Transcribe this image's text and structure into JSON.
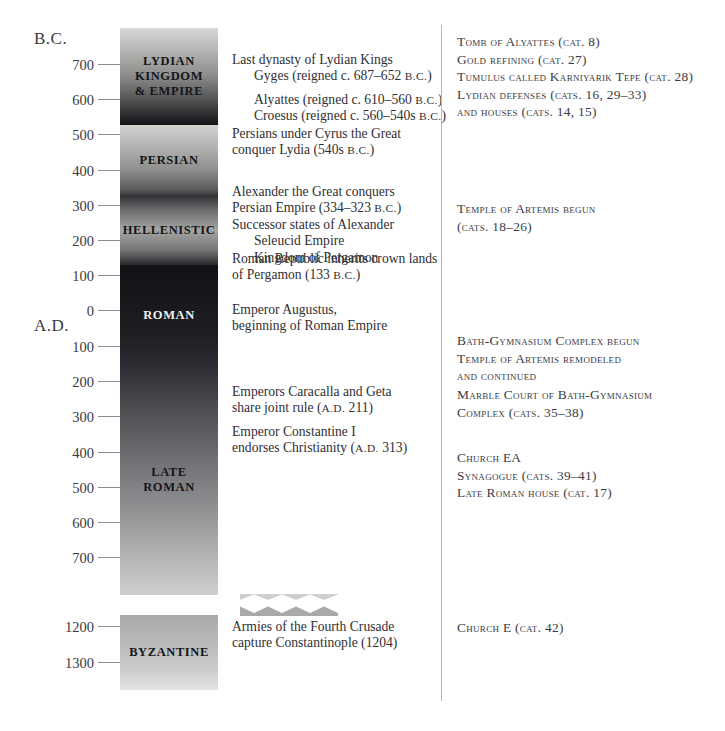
{
  "chart_data": {
    "type": "table",
    "orientation": "vertical",
    "axis": {
      "era_labels": [
        {
          "text": "B.C.",
          "y_px": 38
        },
        {
          "text": "A.D.",
          "y_px": 325
        }
      ],
      "ticks": [
        {
          "label": "700",
          "era": "B.C.",
          "y_px": 65
        },
        {
          "label": "600",
          "era": "B.C.",
          "y_px": 100
        },
        {
          "label": "500",
          "era": "B.C.",
          "y_px": 135
        },
        {
          "label": "400",
          "era": "B.C.",
          "y_px": 171
        },
        {
          "label": "300",
          "era": "B.C.",
          "y_px": 206
        },
        {
          "label": "200",
          "era": "B.C.",
          "y_px": 241
        },
        {
          "label": "100",
          "era": "B.C.",
          "y_px": 276
        },
        {
          "label": "0",
          "era": "",
          "y_px": 311
        },
        {
          "label": "100",
          "era": "A.D.",
          "y_px": 347
        },
        {
          "label": "200",
          "era": "A.D.",
          "y_px": 382
        },
        {
          "label": "300",
          "era": "A.D.",
          "y_px": 417
        },
        {
          "label": "400",
          "era": "A.D.",
          "y_px": 453
        },
        {
          "label": "500",
          "era": "A.D.",
          "y_px": 488
        },
        {
          "label": "600",
          "era": "A.D.",
          "y_px": 523
        },
        {
          "label": "700",
          "era": "A.D.",
          "y_px": 558
        },
        {
          "label": "1200",
          "era": "A.D.",
          "y_px": 627
        },
        {
          "label": "1300",
          "era": "A.D.",
          "y_px": 663
        }
      ],
      "break_between": [
        "700",
        "1200"
      ]
    },
    "periods": [
      {
        "name": "LYDIAN\nKINGDOM\n& EMPIRE",
        "start": "pre-700 B.C.",
        "end": "c. 547 B.C.",
        "y_top_px": 28,
        "y_bottom_px": 125,
        "label_dark": false
      },
      {
        "name": "PERSIAN",
        "start": "c. 547 B.C.",
        "end": "334 B.C.",
        "y_top_px": 125,
        "y_bottom_px": 195,
        "label_dark": false
      },
      {
        "name": "HELLENISTIC",
        "start": "334 B.C.",
        "end": "133 B.C.",
        "y_top_px": 195,
        "y_bottom_px": 265,
        "label_dark": false
      },
      {
        "name": "ROMAN",
        "start": "133 B.C.",
        "end": "c. 284 A.D.",
        "y_top_px": 265,
        "y_bottom_px": 365,
        "label_dark": true
      },
      {
        "name": "LATE\nROMAN",
        "start": "c. 284 A.D.",
        "end": "c. 700 A.D.",
        "y_top_px": 365,
        "y_bottom_px": 595,
        "label_dark": false
      },
      {
        "name": "BYZANTINE",
        "start": "c. 1100 A.D.",
        "end": "1300 A.D.",
        "y_top_px": 615,
        "y_bottom_px": 690,
        "label_dark": false
      }
    ],
    "events": [
      {
        "y_px": 52,
        "lines": [
          "Last dynasty of Lydian Kings",
          "Gyges (reigned c. 687–652 B.C.)"
        ],
        "indents": [
          0,
          1
        ]
      },
      {
        "y_px": 92,
        "lines": [
          "Alyattes (reigned c. 610–560 B.C.)",
          "Croesus (reigned c. 560–540s B.C.)"
        ],
        "indents": [
          1,
          1
        ]
      },
      {
        "y_px": 126,
        "lines": [
          "Persians under Cyrus the Great",
          "conquer Lydia (540s B.C.)"
        ],
        "indents": [
          0,
          0
        ]
      },
      {
        "y_px": 184,
        "lines": [
          "Alexander the Great conquers",
          "Persian Empire (334–323 B.C.)",
          "Successor states of Alexander",
          "Seleucid Empire",
          "Kingdom of Pergamon"
        ],
        "indents": [
          0,
          0,
          0,
          1,
          1
        ]
      },
      {
        "y_px": 251,
        "lines": [
          "Roman Republic inherits crown lands",
          "of Pergamon (133 B.C.)"
        ],
        "indents": [
          0,
          0
        ]
      },
      {
        "y_px": 302,
        "lines": [
          "Emperor Augustus,",
          "beginning of Roman Empire"
        ],
        "indents": [
          0,
          0
        ]
      },
      {
        "y_px": 384,
        "lines": [
          "Emperors Caracalla and Geta",
          "share joint rule (A.D. 211)"
        ],
        "indents": [
          0,
          0
        ]
      },
      {
        "y_px": 424,
        "lines": [
          "Emperor Constantine I",
          "endorses Christianity (A.D. 313)"
        ],
        "indents": [
          0,
          0
        ]
      },
      {
        "y_px": 619,
        "lines": [
          "Armies of the Fourth Crusade",
          "capture Constantinople (1204)"
        ],
        "indents": [
          0,
          0
        ]
      }
    ],
    "catalog_entries": [
      {
        "y_px": 33,
        "lines": [
          "Tomb of Alyattes (cat. 8)",
          "Gold refining (cat. 27)",
          "Tumulus called Karniyarik Tepe (cat. 28)",
          "Lydian defenses (cats. 16, 29–33)",
          "and houses (cats. 14, 15)"
        ]
      },
      {
        "y_px": 200,
        "lines": [
          "Temple of Artemis begun",
          "(cats. 18–26)"
        ]
      },
      {
        "y_px": 332,
        "lines": [
          "Bath-Gymnasium Complex begun",
          "Temple of Artemis remodeled",
          "and continued"
        ]
      },
      {
        "y_px": 386,
        "lines": [
          "Marble Court of Bath-Gymnasium",
          "Complex (cats. 35–38)"
        ]
      },
      {
        "y_px": 449,
        "lines": [
          "Church EA",
          "Synagogue (cats. 39–41)",
          "Late Roman house (cat. 17)"
        ]
      },
      {
        "y_px": 619,
        "lines": [
          "Church E (cat. 42)"
        ]
      }
    ],
    "colors": {
      "text": "#2f2f33",
      "catalog_text": "#3b3b44",
      "tick_rule": "#8d8d92",
      "divider": "#b6b6b8",
      "bar_light": "#d8d8d6",
      "bar_dark": "#121217"
    }
  }
}
